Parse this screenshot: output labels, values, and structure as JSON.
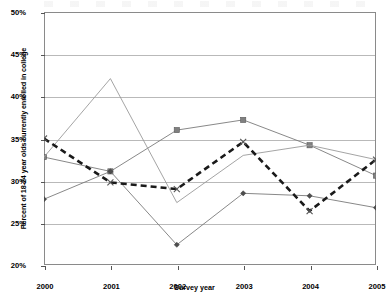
{
  "chart_data": {
    "type": "line",
    "title": "",
    "xlabel": "Survey year",
    "ylabel": "Percent of 18-24 year olds currently enrolled in college",
    "categories": [
      "2000",
      "2001",
      "2002",
      "2003",
      "2004",
      "2005"
    ],
    "x": [
      2000,
      2001,
      2002,
      2003,
      2004,
      2005
    ],
    "xlim": [
      2000,
      2005
    ],
    "ylim": [
      20,
      50
    ],
    "ytick_values": [
      20,
      25,
      30,
      35,
      40,
      45,
      50
    ],
    "ytick_labels": [
      "20%",
      "25%",
      "30%",
      "35%",
      "40%",
      "45%",
      "50%"
    ],
    "xtick_labels": [
      "2000",
      "2001",
      "2002",
      "2003",
      "2004",
      "2005"
    ],
    "grid": "horizontal",
    "legend": "none",
    "series": [
      {
        "name": "series-square",
        "marker": "square",
        "linestyle": "solid",
        "color": "#7a7a7a",
        "marker_color": "#808080",
        "values": [
          32.8,
          31.1,
          36.0,
          37.2,
          34.2,
          30.6
        ]
      },
      {
        "name": "series-diamond",
        "marker": "diamond",
        "linestyle": "solid",
        "color": "#7a7a7a",
        "marker_color": "#4d4d4d",
        "values": [
          27.8,
          31.1,
          22.4,
          28.5,
          28.2,
          26.8
        ]
      },
      {
        "name": "series-triangle",
        "marker": "none",
        "linestyle": "solid",
        "color": "#9a9a9a",
        "marker_color": "#9a9a9a",
        "values": [
          32.8,
          42.1,
          27.4,
          33.0,
          34.2,
          32.5
        ]
      },
      {
        "name": "series-x-dashed",
        "marker": "x",
        "linestyle": "dashed",
        "color": "#1a1a1a",
        "marker_color": "#555555",
        "values": [
          35.0,
          29.8,
          29.0,
          34.6,
          26.4,
          32.5
        ]
      }
    ]
  },
  "axis": {
    "y_title": "Percent of 18-24 year olds currently enrolled in college",
    "x_title": "Survey year"
  },
  "colors": {
    "frame": "#8a8a8a",
    "gridline": "#b9b9b9",
    "background": "#ffffff",
    "dashed_series": "#1a1a1a",
    "gray_series": "#7a7a7a"
  }
}
